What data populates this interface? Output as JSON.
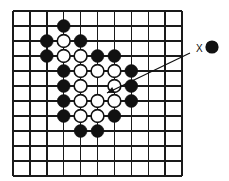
{
  "figure": {
    "type": "go-board-diagram",
    "title": "",
    "width": 229,
    "height": 181,
    "background_color": "#ffffff"
  },
  "board": {
    "name": "go-board-grid",
    "line_color": "#1a1a1a",
    "line_width": 1.4,
    "origin_x": 13,
    "origin_y": 11,
    "spacing_x": 16.9,
    "spacing_y": 15.0,
    "columns": 11,
    "rows": 12,
    "col_positions": [
      13,
      29.9,
      46.8,
      63.7,
      80.6,
      97.5,
      114.4,
      131.3,
      148.2,
      165.1,
      182
    ],
    "row_positions": [
      11,
      26,
      41,
      56,
      71,
      86,
      101,
      116,
      131,
      146,
      161,
      176
    ]
  },
  "stones": {
    "black_color": "#111111",
    "white_color": "#ffffff",
    "white_outline_color": "#111111",
    "radius": 6.4,
    "outline_width": 1.6,
    "black": [
      {
        "col": 3,
        "row": 1,
        "label": "black-stone"
      },
      {
        "col": 2,
        "row": 2,
        "label": "black-stone"
      },
      {
        "col": 4,
        "row": 2,
        "label": "black-stone"
      },
      {
        "col": 2,
        "row": 3,
        "label": "black-stone"
      },
      {
        "col": 5,
        "row": 3,
        "label": "black-stone"
      },
      {
        "col": 6,
        "row": 3,
        "label": "black-stone"
      },
      {
        "col": 3,
        "row": 4,
        "label": "black-stone"
      },
      {
        "col": 7,
        "row": 4,
        "label": "black-stone"
      },
      {
        "col": 3,
        "row": 5,
        "label": "black-stone"
      },
      {
        "col": 7,
        "row": 5,
        "label": "black-stone"
      },
      {
        "col": 3,
        "row": 6,
        "label": "black-stone"
      },
      {
        "col": 7,
        "row": 6,
        "label": "black-stone"
      },
      {
        "col": 3,
        "row": 7,
        "label": "black-stone"
      },
      {
        "col": 6,
        "row": 7,
        "label": "black-stone"
      },
      {
        "col": 4,
        "row": 8,
        "label": "black-stone"
      },
      {
        "col": 5,
        "row": 8,
        "label": "black-stone"
      }
    ],
    "white": [
      {
        "col": 3,
        "row": 2,
        "label": "white-stone"
      },
      {
        "col": 3,
        "row": 3,
        "label": "white-stone"
      },
      {
        "col": 4,
        "row": 3,
        "label": "white-stone"
      },
      {
        "col": 4,
        "row": 4,
        "label": "white-stone"
      },
      {
        "col": 5,
        "row": 4,
        "label": "white-stone"
      },
      {
        "col": 6,
        "row": 4,
        "label": "white-stone"
      },
      {
        "col": 4,
        "row": 5,
        "label": "white-stone"
      },
      {
        "col": 6,
        "row": 5,
        "label": "white-stone"
      },
      {
        "col": 4,
        "row": 6,
        "label": "white-stone"
      },
      {
        "col": 5,
        "row": 6,
        "label": "white-stone"
      },
      {
        "col": 6,
        "row": 6,
        "label": "white-stone"
      },
      {
        "col": 4,
        "row": 7,
        "label": "white-stone"
      },
      {
        "col": 5,
        "row": 7,
        "label": "white-stone"
      }
    ]
  },
  "annotation": {
    "label_text": "X",
    "label_x": 196,
    "label_y": 44,
    "legend_stone": {
      "name": "legend-black-stone",
      "cx": 212,
      "cy": 47,
      "r": 6.6,
      "color": "#111111"
    },
    "arrow": {
      "name": "pointer-arrow",
      "color": "#111111",
      "width": 1.2,
      "x1": 190,
      "y1": 53,
      "x2": 107,
      "y2": 93,
      "head_size": 8
    }
  }
}
